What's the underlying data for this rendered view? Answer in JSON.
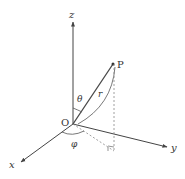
{
  "diagram": {
    "labels": {
      "z_axis": "z",
      "y_axis": "y",
      "x_axis": "x",
      "origin": "O",
      "point": "P",
      "radius": "r",
      "polar_angle": "θ",
      "azimuth_angle": "φ"
    },
    "colors": {
      "line": "#444444",
      "dashed": "#888888",
      "text": "#333333"
    }
  }
}
